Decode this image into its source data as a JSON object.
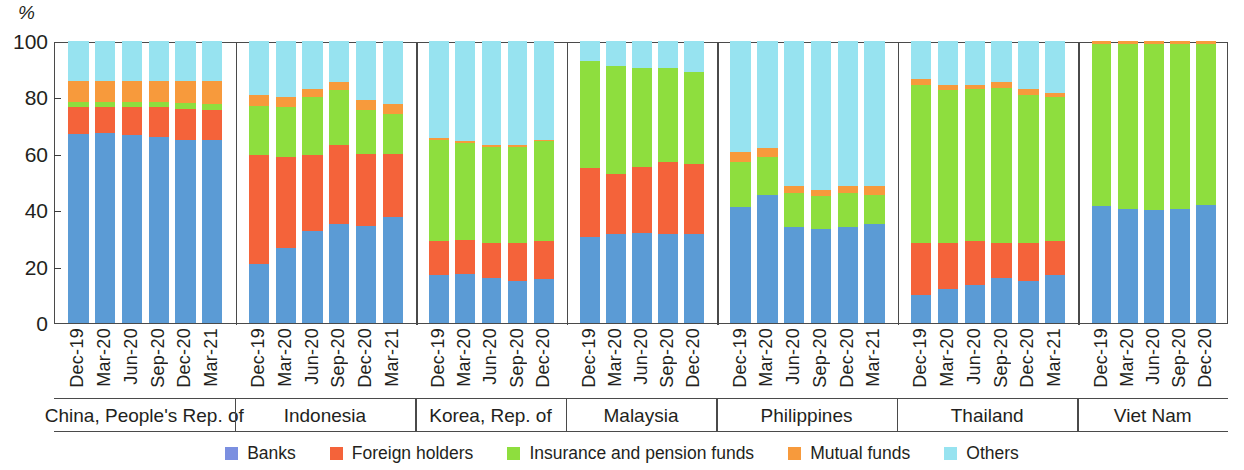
{
  "axis": {
    "unit_label": "%",
    "y_ticks": [
      0,
      20,
      40,
      60,
      80,
      100
    ],
    "y_min": 0,
    "y_max": 100
  },
  "legend": {
    "items": [
      {
        "label": "Banks",
        "color": "#7b8fe0",
        "key": "banks"
      },
      {
        "label": "Foreign holders",
        "color": "#f4633a",
        "key": "foreign"
      },
      {
        "label": "Insurance and pension funds",
        "color": "#8ede3e",
        "key": "insurance"
      },
      {
        "label": "Mutual funds",
        "color": "#f79a3c",
        "key": "mutual"
      },
      {
        "label": "Others",
        "color": "#97e3f0",
        "key": "others"
      }
    ]
  },
  "chart_data": {
    "type": "bar",
    "subtype": "stacked-100-percent-grouped",
    "title": "",
    "xlabel": "",
    "ylabel": "%",
    "ylim": [
      0,
      100
    ],
    "yticks": [
      0,
      20,
      40,
      60,
      80,
      100
    ],
    "grid": false,
    "legend_position": "bottom",
    "series": [
      {
        "name": "Banks",
        "color": "#5b9bd5"
      },
      {
        "name": "Foreign holders",
        "color": "#f4633a"
      },
      {
        "name": "Insurance and pension funds",
        "color": "#8ede3e"
      },
      {
        "name": "Mutual funds",
        "color": "#f79a3c"
      },
      {
        "name": "Others",
        "color": "#97e3f0"
      }
    ],
    "groups": [
      {
        "name": "China, People's Rep. of",
        "categories": [
          "Dec-19",
          "Mar-20",
          "Jun-20",
          "Sep-20",
          "Dec-20",
          "Mar-21"
        ],
        "values": {
          "banks": [
            67.0,
            67.5,
            66.5,
            66.0,
            65.0,
            65.0
          ],
          "foreign": [
            9.5,
            9.0,
            10.0,
            10.5,
            11.0,
            10.5
          ],
          "insurance": [
            2.0,
            2.0,
            2.0,
            2.0,
            2.0,
            2.0
          ],
          "mutual": [
            7.5,
            7.5,
            7.5,
            7.5,
            8.0,
            8.5
          ],
          "others": [
            14.0,
            14.0,
            14.0,
            14.0,
            14.0,
            14.0
          ]
        }
      },
      {
        "name": "Indonesia",
        "categories": [
          "Dec-19",
          "Mar-20",
          "Jun-20",
          "Sep-20",
          "Dec-20",
          "Mar-21"
        ],
        "values": {
          "banks": [
            21.0,
            26.5,
            32.5,
            35.0,
            34.5,
            37.5
          ],
          "foreign": [
            38.5,
            32.5,
            27.0,
            28.0,
            25.5,
            22.5
          ],
          "insurance": [
            17.5,
            17.5,
            20.5,
            19.5,
            15.5,
            14.0
          ],
          "mutual": [
            4.0,
            3.5,
            3.0,
            3.0,
            3.5,
            3.5
          ],
          "others": [
            19.0,
            20.0,
            17.0,
            14.5,
            21.0,
            22.5
          ]
        }
      },
      {
        "name": "Korea, Rep. of",
        "categories": [
          "Dec-19",
          "Mar-20",
          "Jun-20",
          "Sep-20",
          "Dec-20"
        ],
        "values": {
          "banks": [
            17.0,
            17.5,
            16.0,
            15.0,
            15.5
          ],
          "foreign": [
            12.0,
            12.0,
            12.5,
            13.5,
            13.5
          ],
          "insurance": [
            36.0,
            34.5,
            34.0,
            34.0,
            35.5
          ],
          "mutual": [
            0.5,
            0.5,
            0.8,
            0.5,
            0.5
          ],
          "others": [
            34.5,
            35.5,
            36.7,
            37.0,
            35.0
          ]
        }
      },
      {
        "name": "Malaysia",
        "categories": [
          "Dec-19",
          "Mar-20",
          "Jun-20",
          "Sep-20",
          "Dec-20"
        ],
        "values": {
          "banks": [
            30.5,
            31.5,
            32.0,
            31.5,
            31.5
          ],
          "foreign": [
            24.5,
            21.5,
            23.5,
            25.5,
            25.0
          ],
          "insurance": [
            38.0,
            38.0,
            35.0,
            33.5,
            32.5
          ],
          "mutual": [
            0.0,
            0.0,
            0.0,
            0.0,
            0.0
          ],
          "others": [
            7.0,
            9.0,
            9.5,
            9.5,
            11.0
          ]
        }
      },
      {
        "name": "Philippines",
        "categories": [
          "Dec-19",
          "Mar-20",
          "Jun-20",
          "Sep-20",
          "Dec-20",
          "Mar-21"
        ],
        "values": {
          "banks": [
            41.0,
            45.5,
            34.0,
            33.5,
            34.0,
            35.0
          ],
          "foreign": [
            0.0,
            0.0,
            0.0,
            0.0,
            0.0,
            0.0
          ],
          "insurance": [
            0.0,
            0.0,
            0.0,
            0.0,
            0.0,
            0.0
          ],
          "mutual": [
            3.5,
            3.0,
            2.5,
            2.0,
            2.5,
            3.0
          ],
          "others": [
            55.5,
            51.5,
            63.5,
            64.5,
            63.5,
            62.0
          ]
        },
        "insurance_values": [
          16.0,
          13.5,
          12.0,
          11.5,
          12.0,
          10.5
        ],
        "others_values": [
          39.5,
          38.0,
          51.5,
          53.0,
          51.5,
          51.5
        ]
      },
      {
        "name": "Thailand",
        "categories": [
          "Dec-19",
          "Mar-20",
          "Jun-20",
          "Sep-20",
          "Dec-20",
          "Mar-21"
        ],
        "values": {
          "banks": [
            10.0,
            12.0,
            13.5,
            16.0,
            15.0,
            17.0
          ],
          "foreign": [
            18.5,
            16.5,
            15.5,
            12.5,
            13.5,
            12.0
          ],
          "insurance": [
            56.0,
            54.0,
            54.0,
            55.0,
            52.5,
            51.0
          ],
          "mutual": [
            2.0,
            2.0,
            1.5,
            2.0,
            2.0,
            1.5
          ],
          "others": [
            13.5,
            15.5,
            15.5,
            14.5,
            17.0,
            18.5
          ]
        }
      },
      {
        "name": "Viet Nam",
        "categories": [
          "Dec-19",
          "Mar-20",
          "Jun-20",
          "Sep-20",
          "Dec-20"
        ],
        "values": {
          "banks": [
            41.5,
            40.5,
            40.0,
            40.5,
            42.0
          ],
          "foreign": [
            0.0,
            0.0,
            0.0,
            0.0,
            0.0
          ],
          "insurance": [
            57.5,
            58.5,
            59.0,
            58.5,
            57.0
          ],
          "mutual": [
            1.0,
            1.0,
            1.0,
            1.0,
            1.0
          ],
          "others": [
            0.0,
            0.0,
            0.0,
            0.0,
            0.0
          ]
        }
      }
    ]
  }
}
